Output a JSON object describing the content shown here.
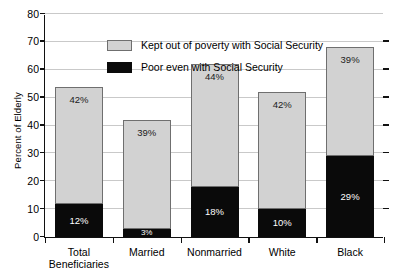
{
  "chart_data": {
    "type": "bar",
    "stacked": true,
    "title": "",
    "xlabel": "",
    "ylabel": "Percent of Elderly",
    "ylim": [
      0,
      80
    ],
    "yticks": [
      0,
      10,
      20,
      30,
      40,
      50,
      60,
      70,
      80
    ],
    "grid": true,
    "legend_position": "top-left-inside",
    "categories": [
      "Total\nBeneficiaries",
      "Married",
      "Nonmarried",
      "White",
      "Black"
    ],
    "series": [
      {
        "name": "Poor even with Social Security",
        "color": "#0a0a0a",
        "values": [
          12,
          3,
          18,
          10,
          29
        ],
        "labels": [
          "12%",
          "3%",
          "18%",
          "10%",
          "29%"
        ]
      },
      {
        "name": "Kept out of poverty with Social Security",
        "color": "#d2d2d2",
        "values": [
          42,
          39,
          44,
          42,
          39
        ],
        "labels": [
          "42%",
          "39%",
          "44%",
          "42%",
          "39%"
        ]
      }
    ],
    "totals": [
      54,
      42,
      62,
      52,
      68
    ]
  },
  "axis": {
    "y_title": "Percent of Elderly",
    "y_tick_labels": [
      "0",
      "10",
      "20",
      "30",
      "40",
      "50",
      "60",
      "70",
      "80"
    ]
  },
  "legend": {
    "items": [
      {
        "label": "Kept out of poverty with Social Security",
        "swatch": "gray"
      },
      {
        "label": "Poor even with Social Security",
        "swatch": "black"
      }
    ]
  }
}
